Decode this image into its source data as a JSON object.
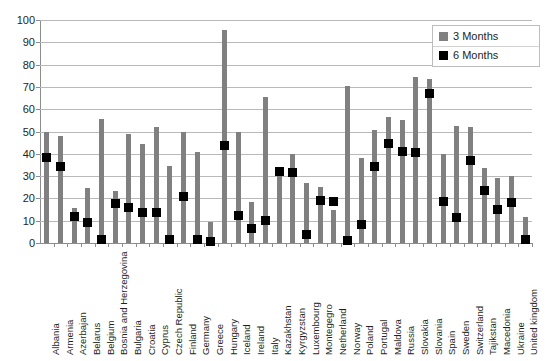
{
  "chart_data": {
    "type": "bar",
    "title": "",
    "subtitle": "",
    "xlabel": "",
    "ylabel": "",
    "ylim": [
      0,
      100
    ],
    "yticks": [
      0,
      10,
      20,
      30,
      40,
      50,
      60,
      70,
      80,
      90,
      100
    ],
    "grid": true,
    "legend_position": "top-right",
    "categories": [
      "Albania",
      "Armenia",
      "Azerbajan",
      "Belarus",
      "Belgium",
      "Bosnia and Herzegovina",
      "Bulgaria",
      "Croatia",
      "Cyprus",
      "Czech Republic",
      "Finland",
      "Germany",
      "Greece",
      "Hungary",
      "Iceland",
      "Ireland",
      "Italy",
      "Kazakhstan",
      "Kyrgyzstan",
      "Luxembourg",
      "Montegegro",
      "Netherland",
      "Norway",
      "Poland",
      "Portugal",
      "Maldova",
      "Russia",
      "Slovakia",
      "Slovania",
      "Spain",
      "Sweden",
      "Switzerland",
      "Tajikstan",
      "Macedonia",
      "Ukraine",
      "United kingdom"
    ],
    "series": [
      {
        "name": "3 Months",
        "color": "#808080",
        "marker": "bar",
        "values": [
          50,
          48,
          15.5,
          24.5,
          55.5,
          23.5,
          49,
          44.5,
          52,
          34.5,
          50,
          41,
          9.5,
          95.5,
          50,
          18.5,
          65.5,
          32,
          40,
          27,
          25,
          15,
          70.5,
          38,
          50.5,
          56.5,
          55,
          74.5,
          73.5,
          40,
          52.5,
          52,
          33.5,
          29,
          30,
          11.5
        ]
      },
      {
        "name": "6 Months",
        "color": "#000000",
        "marker": "square",
        "values": [
          38.5,
          34.5,
          12,
          9,
          1.5,
          17.5,
          16,
          13.5,
          13.5,
          1.5,
          21,
          1.5,
          0.5,
          43.5,
          12.5,
          6.5,
          10,
          32,
          31.5,
          4,
          19,
          18.5,
          1,
          8.5,
          34.5,
          44.5,
          41,
          40.5,
          67,
          18.5,
          11.5,
          37,
          23.5,
          15,
          18,
          1.5
        ]
      }
    ]
  },
  "legend": {
    "entries": [
      {
        "label": "3 Months",
        "color": "#808080"
      },
      {
        "label": "6 Months",
        "color": "#000000"
      }
    ]
  },
  "axis": {
    "y_tick_labels": [
      "100",
      "90",
      "80",
      "70",
      "60",
      "50",
      "40",
      "30",
      "20",
      "10",
      "0"
    ]
  }
}
